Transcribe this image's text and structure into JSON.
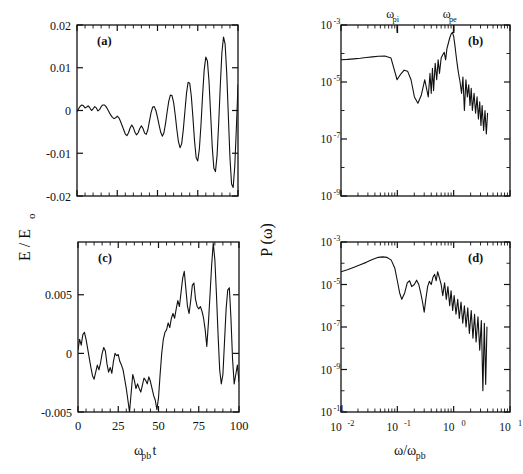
{
  "figure": {
    "background": "#ffffff",
    "ink": "#111111",
    "axis_label_left": "E / E",
    "axis_label_left_sub": "o",
    "axis_label_right": "P (ω)",
    "xlabel_left": "ω",
    "xlabel_left_sub": "pb",
    "xlabel_left_tail": "t",
    "xlabel_right": "ω/ω",
    "xlabel_right_sub": "pb"
  },
  "annotations": {
    "omega_pi": "ω",
    "omega_pi_sub": "pi",
    "omega_pe": "ω",
    "omega_pe_sub": "pe"
  },
  "chart_data": [
    {
      "type": "line",
      "panel": "a",
      "label": "(a)",
      "title": "",
      "xlabel": "ω_pb t",
      "ylabel": "E / E_o",
      "xscale": "linear",
      "yscale": "linear",
      "xlim": [
        0,
        100
      ],
      "ylim": [
        -0.02,
        0.02
      ],
      "xticks": [
        0,
        25,
        50,
        75,
        100
      ],
      "xticklabels": [
        "",
        "",
        "",
        "",
        ""
      ],
      "yticks": [
        -0.02,
        -0.01,
        0,
        0.01,
        0.02
      ],
      "yticklabels": [
        "-0.02",
        "-0.01",
        "0",
        "0.01",
        "0.02"
      ],
      "grid": false,
      "legend": "none",
      "description": "Growing electric field oscillation (beam instability), amplitude grows from ~0.001 to ~0.02 saturating near t=100",
      "x": [
        0,
        1,
        2,
        3,
        4,
        5,
        6,
        7,
        8,
        9,
        10,
        11,
        12,
        13,
        14,
        15,
        16,
        17,
        18,
        19,
        20,
        21,
        22,
        23,
        24,
        25,
        26,
        27,
        28,
        29,
        30,
        31,
        32,
        33,
        34,
        35,
        36,
        37,
        38,
        39,
        40,
        41,
        42,
        43,
        44,
        45,
        46,
        47,
        48,
        49,
        50,
        51,
        52,
        53,
        54,
        55,
        56,
        57,
        58,
        59,
        60,
        61,
        62,
        63,
        64,
        65,
        66,
        67,
        68,
        69,
        70,
        71,
        72,
        73,
        74,
        75,
        76,
        77,
        78,
        79,
        80,
        81,
        82,
        83,
        84,
        85,
        86,
        87,
        88,
        89,
        90,
        91,
        92,
        93,
        94,
        95,
        96,
        97,
        98,
        99,
        100
      ],
      "y": [
        -0.0002,
        0.0004,
        0.001,
        0.0013,
        0.0011,
        0.0006,
        0.0008,
        0.0011,
        0.0006,
        0.0,
        0.0004,
        0.0009,
        0.0006,
        -0.0001,
        0.0002,
        0.0009,
        0.0013,
        0.0013,
        0.0009,
        0.0003,
        -0.0004,
        -0.0011,
        -0.0016,
        -0.0019,
        -0.0017,
        -0.0013,
        -0.0017,
        -0.0025,
        -0.0035,
        -0.0045,
        -0.0055,
        -0.0059,
        -0.0052,
        -0.0041,
        -0.0034,
        -0.004,
        -0.0051,
        -0.0057,
        -0.0052,
        -0.0042,
        -0.0036,
        -0.0042,
        -0.0053,
        -0.0056,
        -0.0045,
        -0.0025,
        -0.0005,
        0.0008,
        0.0009,
        0.0,
        -0.0016,
        -0.0034,
        -0.0051,
        -0.006,
        -0.0052,
        -0.003,
        -0.0003,
        0.0022,
        0.0036,
        0.0035,
        0.0019,
        -0.001,
        -0.0044,
        -0.0073,
        -0.0087,
        -0.0078,
        -0.0046,
        -0.0003,
        0.004,
        0.0066,
        0.0064,
        0.0034,
        -0.0016,
        -0.0071,
        -0.011,
        -0.0118,
        -0.009,
        -0.0034,
        0.0035,
        0.0095,
        0.0125,
        0.0116,
        0.0068,
        -0.0008,
        -0.0085,
        -0.0135,
        -0.0143,
        -0.0105,
        -0.003,
        0.0058,
        0.0135,
        0.0172,
        0.0155,
        0.0087,
        -0.0012,
        -0.011,
        -0.0172,
        -0.018,
        -0.013,
        -0.004,
        0.006
      ]
    },
    {
      "type": "line",
      "panel": "b",
      "label": "(b)",
      "title": "",
      "xlabel": "ω/ω_pb",
      "ylabel": "P (ω)",
      "xscale": "log",
      "yscale": "log",
      "xlim": [
        0.01,
        10
      ],
      "ylim": [
        1e-09,
        0.001
      ],
      "xticks": [
        0.01,
        0.1,
        1,
        10
      ],
      "xticklabels": [
        "",
        "",
        "",
        ""
      ],
      "yticks": [
        0.001,
        1e-05,
        1e-07,
        1e-09
      ],
      "yticklabels": [
        "10-3",
        "10-5",
        "10-7",
        "10-9"
      ],
      "grid": false,
      "legend": "none",
      "markers": [
        {
          "name": "omega_pi",
          "x": 0.1,
          "label": "ω_pi"
        },
        {
          "name": "omega_pe",
          "x": 1.0,
          "label": "ω_pe"
        }
      ],
      "description": "Power spectrum: flat plateau near 6e-5 up to omega_pi, dip, noisy rise to sharp peak ~5e-4 at omega_pe, then steep noisy decay to 1e-8",
      "x": [
        0.01,
        0.013,
        0.017,
        0.022,
        0.028,
        0.036,
        0.046,
        0.06,
        0.077,
        0.099,
        0.115,
        0.132,
        0.152,
        0.175,
        0.201,
        0.232,
        0.267,
        0.307,
        0.354,
        0.38,
        0.4,
        0.42,
        0.44,
        0.47,
        0.5,
        0.53,
        0.56,
        0.6,
        0.64,
        0.68,
        0.72,
        0.76,
        0.8,
        0.85,
        0.9,
        0.95,
        1.0,
        1.05,
        1.1,
        1.16,
        1.22,
        1.3,
        1.38,
        1.46,
        1.55,
        1.65,
        1.75,
        1.85,
        1.95,
        2.05,
        2.15,
        2.3,
        2.45,
        2.6,
        2.75,
        2.9,
        3.05,
        3.2,
        3.4,
        3.6,
        3.8,
        4.0
      ],
      "y": [
        6e-05,
        6.2e-05,
        6.5e-05,
        6.8e-05,
        7.2e-05,
        7.6e-05,
        8e-05,
        8.2e-05,
        7e-05,
        1.2e-05,
        1.9e-05,
        2.6e-05,
        2.4e-05,
        1.2e-05,
        3e-06,
        1.8e-06,
        3.5e-06,
        1.2e-05,
        3e-06,
        2e-05,
        4e-06,
        3e-05,
        5e-06,
        4.5e-05,
        1.2e-05,
        6e-05,
        2e-05,
        7e-05,
        9e-05,
        0.00011,
        6e-05,
        0.00015,
        0.00022,
        0.00035,
        0.00048,
        0.00055,
        0.0004,
        0.0002,
        9e-05,
        4e-05,
        2e-05,
        1e-05,
        4e-06,
        1.5e-05,
        1e-06,
        1.2e-05,
        3e-06,
        8e-06,
        1.5e-06,
        6e-06,
        1e-06,
        4e-06,
        8e-07,
        3e-06,
        5e-07,
        2e-06,
        3e-07,
        1.5e-06,
        2e-07,
        1e-06,
        1.5e-07,
        8e-07
      ]
    },
    {
      "type": "line",
      "panel": "c",
      "label": "(c)",
      "title": "",
      "xlabel": "ω_pb t",
      "ylabel": "E / E_o",
      "xscale": "linear",
      "yscale": "linear",
      "xlim": [
        0,
        100
      ],
      "ylim": [
        -0.005,
        0.0095
      ],
      "xticks": [
        0,
        25,
        50,
        75,
        100
      ],
      "xticklabels": [
        "0",
        "25",
        "50",
        "75",
        "100"
      ],
      "yticks": [
        -0.005,
        0,
        0.005
      ],
      "yticklabels": [
        "-0.005",
        "0",
        "0.005"
      ],
      "grid": false,
      "legend": "none",
      "description": "Irregular turbulent field: noisy around 0 until t~50, then rises to plateau 0.003-0.007 with large spikes near t=84 and t=94",
      "x": [
        0,
        1,
        2,
        3,
        4,
        5,
        6,
        7,
        8,
        9,
        10,
        11,
        12,
        13,
        14,
        15,
        16,
        17,
        18,
        19,
        20,
        21,
        22,
        23,
        24,
        25,
        26,
        27,
        28,
        29,
        30,
        31,
        32,
        33,
        34,
        35,
        36,
        37,
        38,
        39,
        40,
        41,
        42,
        43,
        44,
        45,
        46,
        47,
        48,
        49,
        50,
        51,
        52,
        53,
        54,
        55,
        56,
        57,
        58,
        59,
        60,
        61,
        62,
        63,
        64,
        65,
        66,
        67,
        68,
        69,
        70,
        71,
        72,
        73,
        74,
        75,
        76,
        77,
        78,
        79,
        80,
        81,
        82,
        83,
        84,
        85,
        86,
        87,
        88,
        89,
        90,
        91,
        92,
        93,
        94,
        95,
        96,
        97,
        98,
        99,
        100
      ],
      "y": [
        0.0003,
        0.0012,
        0.0007,
        0.0016,
        0.0018,
        0.0012,
        0.0004,
        -0.0004,
        -0.0012,
        -0.0019,
        -0.0022,
        -0.0016,
        -0.001,
        -0.0014,
        -0.0008,
        0.0,
        0.0005,
        0.0002,
        -0.0009,
        -0.0016,
        -0.0012,
        -0.0017,
        -0.0007,
        0.0,
        -0.0002,
        -0.0001,
        -0.0007,
        -0.001,
        -0.0014,
        -0.0022,
        -0.003,
        -0.004,
        -0.005,
        -0.0034,
        -0.0018,
        -0.0023,
        -0.003,
        -0.0026,
        -0.003,
        -0.0033,
        -0.0027,
        -0.0021,
        -0.0023,
        -0.0026,
        -0.002,
        -0.0024,
        -0.003,
        -0.0036,
        -0.004,
        -0.0048,
        -0.0038,
        -0.0018,
        0.0,
        0.0012,
        0.0018,
        0.002,
        0.0026,
        0.0022,
        0.003,
        0.0034,
        0.003,
        0.0038,
        0.0045,
        0.004,
        0.0052,
        0.0064,
        0.007,
        0.0055,
        0.004,
        0.0034,
        0.0045,
        0.0058,
        0.006,
        0.0046,
        0.004,
        0.0038,
        0.004,
        0.0036,
        0.003,
        0.002,
        0.0006,
        0.0026,
        0.005,
        0.0075,
        0.0094,
        0.008,
        0.005,
        0.0016,
        -0.0014,
        -0.0026,
        -0.0018,
        0.001,
        0.0038,
        0.0054,
        0.0056,
        0.003,
        -0.0005,
        -0.0026,
        -0.0018,
        -0.001,
        -0.0024
      ]
    },
    {
      "type": "line",
      "panel": "d",
      "label": "(d)",
      "title": "",
      "xlabel": "ω/ω_pb",
      "ylabel": "P (ω)",
      "xscale": "log",
      "yscale": "log",
      "xlim": [
        0.01,
        10
      ],
      "ylim": [
        1e-11,
        0.001
      ],
      "xticks": [
        0.01,
        0.1,
        1,
        10
      ],
      "xticklabels": [
        "10-2",
        "10-1",
        "100",
        "101"
      ],
      "yticks": [
        0.001,
        1e-05,
        1e-07,
        1e-09,
        1e-11
      ],
      "yticklabels": [
        "10-3",
        "10-5",
        "10-7",
        "10-9",
        "10-11"
      ],
      "grid": false,
      "legend": "none",
      "description": "Power spectrum: rises from 4e-5 to broad maximum 2e-4 near 0.07, falls to 2e-6 at 0.15, noisy band 1e-5 to 1e-6 through 0.5, then steep jagged decay to 1e-10 beyond 1",
      "x": [
        0.01,
        0.013,
        0.017,
        0.022,
        0.028,
        0.036,
        0.046,
        0.055,
        0.065,
        0.078,
        0.09,
        0.1,
        0.11,
        0.12,
        0.135,
        0.15,
        0.165,
        0.18,
        0.2,
        0.22,
        0.24,
        0.26,
        0.28,
        0.3,
        0.32,
        0.345,
        0.37,
        0.4,
        0.43,
        0.46,
        0.49,
        0.52,
        0.56,
        0.6,
        0.64,
        0.69,
        0.74,
        0.79,
        0.85,
        0.9,
        0.96,
        1.02,
        1.1,
        1.18,
        1.26,
        1.35,
        1.45,
        1.55,
        1.66,
        1.78,
        1.9,
        2.05,
        2.2,
        2.35,
        2.5,
        2.7,
        2.9,
        3.1,
        3.3,
        3.5,
        3.7,
        3.9
      ],
      "y": [
        4e-05,
        5e-05,
        6.5e-05,
        8.5e-05,
        0.00011,
        0.00015,
        0.00019,
        0.0002,
        0.00019,
        0.00014,
        6e-05,
        1.5e-05,
        4e-06,
        2e-06,
        4e-06,
        1.2e-05,
        1.5e-05,
        8e-06,
        1e-05,
        1.6e-05,
        1e-05,
        4e-06,
        1.5e-06,
        5e-07,
        2e-06,
        8e-06,
        1.4e-05,
        1e-05,
        2.2e-05,
        3e-05,
        1.5e-05,
        4e-05,
        2e-05,
        1e-05,
        3e-06,
        1.2e-05,
        2e-06,
        8e-06,
        1e-06,
        5e-06,
        6e-07,
        3e-06,
        4e-07,
        2e-06,
        2.5e-07,
        1.5e-06,
        1.5e-07,
        1e-06,
        1e-07,
        8e-07,
        5e-08,
        6e-07,
        3e-08,
        4e-07,
        2e-08,
        3e-07,
        8e-09,
        2e-07,
        1e-10,
        1.5e-07,
        2e-10,
        1e-07
      ]
    }
  ]
}
